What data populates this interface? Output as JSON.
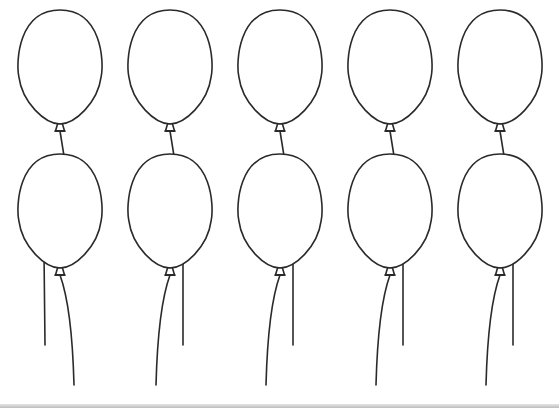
{
  "worksheet": {
    "balloon_outline_color": "#2a2a2a",
    "balloon_fill_color": "#ffffff",
    "columns": 5,
    "rows": 2,
    "column_centers_x": [
      60,
      170,
      280,
      390,
      500
    ],
    "top_row_center_y": 68,
    "bottom_row_center_y": 212,
    "balloon_rx": 42,
    "balloon_ry": 58
  },
  "balloons": [
    {
      "id": "top-1"
    },
    {
      "id": "top-2"
    },
    {
      "id": "top-3"
    },
    {
      "id": "top-4"
    },
    {
      "id": "top-5"
    },
    {
      "id": "bottom-1"
    },
    {
      "id": "bottom-2"
    },
    {
      "id": "bottom-3"
    },
    {
      "id": "bottom-4"
    },
    {
      "id": "bottom-5"
    }
  ]
}
